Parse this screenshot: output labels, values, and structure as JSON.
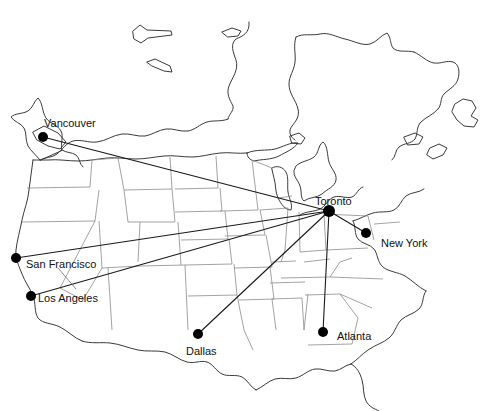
{
  "figure": {
    "kind": "route-map",
    "region": "North America",
    "background_color": "#ffffff",
    "outline_color": "#3a3a3a",
    "border_color": "#7a7a7a",
    "route_color": "#1a1a1a",
    "marker_color": "#000000",
    "label_color": "#111111",
    "hub": "Toronto"
  },
  "cities": [
    {
      "id": "vancouver",
      "name": "Vancouver",
      "x": 43,
      "y": 137,
      "label_x": 44,
      "label_y": 118,
      "leader": false
    },
    {
      "id": "san-francisco",
      "name": "San Francisco",
      "x": 16,
      "y": 258,
      "label_x": 26,
      "label_y": 259,
      "leader": true,
      "leader_x": 58,
      "leader_y": 289
    },
    {
      "id": "los-angeles",
      "name": "Los Angeles",
      "x": 31,
      "y": 296,
      "label_x": 38,
      "label_y": 293,
      "leader": false
    },
    {
      "id": "dallas",
      "name": "Dallas",
      "x": 198,
      "y": 334,
      "label_x": 186,
      "label_y": 346,
      "leader": false
    },
    {
      "id": "atlanta",
      "name": "Atlanta",
      "x": 323,
      "y": 332,
      "label_x": 337,
      "label_y": 331,
      "leader": false
    },
    {
      "id": "new-york",
      "name": "New York",
      "x": 366,
      "y": 233,
      "label_x": 381,
      "label_y": 238,
      "leader": false
    },
    {
      "id": "toronto",
      "name": "Toronto",
      "x": 329,
      "y": 211,
      "label_x": 315,
      "label_y": 196,
      "leader": false
    }
  ],
  "routes": [
    {
      "id": "toronto-vancouver",
      "from": "toronto",
      "to": "vancouver"
    },
    {
      "id": "toronto-san-francisco",
      "from": "toronto",
      "to": "san-francisco"
    },
    {
      "id": "toronto-los-angeles",
      "from": "toronto",
      "to": "los-angeles"
    },
    {
      "id": "toronto-dallas",
      "from": "toronto",
      "to": "dallas"
    },
    {
      "id": "toronto-atlanta",
      "from": "toronto",
      "to": "atlanta"
    },
    {
      "id": "toronto-new-york",
      "from": "toronto",
      "to": "new-york"
    }
  ],
  "caption": {
    "text": "",
    "legible": false
  }
}
